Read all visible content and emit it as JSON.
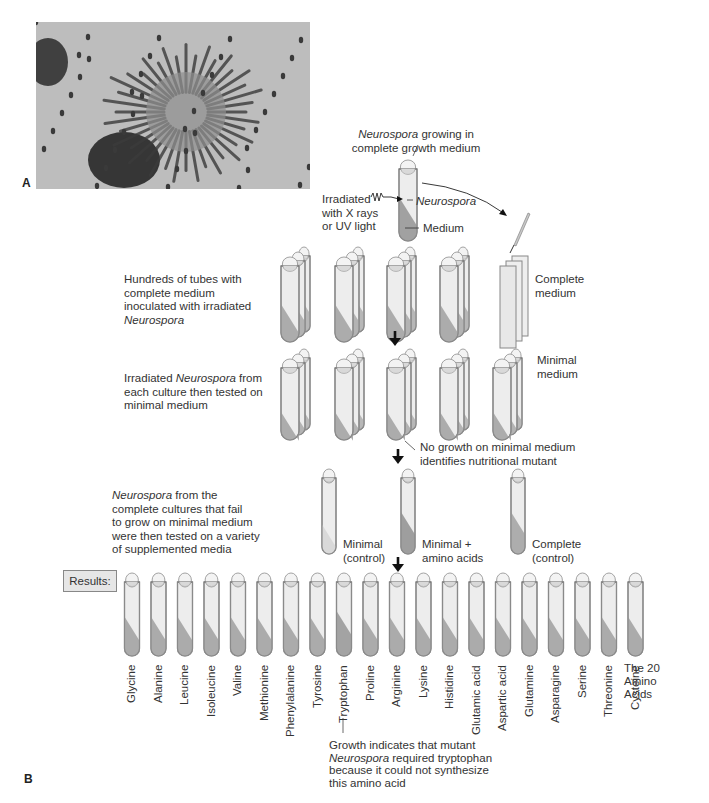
{
  "panels": {
    "a": "A",
    "b": "B"
  },
  "top_tube": {
    "caption_italic": "Neurospora",
    "caption_rest": " growing in",
    "caption_line2": "complete growth medium",
    "irradiation_label": [
      "Irradiated",
      "with X rays",
      "or UV light"
    ],
    "neurospora_label": "Neurospora",
    "medium_label": "Medium"
  },
  "steps": [
    {
      "lines_html": [
        "Hundreds of tubes with",
        "complete medium",
        "inoculated with irradiated"
      ],
      "italic_last": "Neurospora",
      "side_label": [
        "Complete",
        "medium"
      ]
    },
    {
      "line1_pre": "Irradiated ",
      "line1_italic": "Neurospora",
      "line1_post": " from",
      "lines": [
        "each culture then tested on",
        "minimal medium"
      ],
      "side_label": [
        "Minimal",
        "medium"
      ],
      "note": [
        "No growth on minimal medium",
        "identifies nutritional mutant"
      ]
    },
    {
      "line1_italic": "Neurospora",
      "line1_post": " from the",
      "lines": [
        "complete cultures that fail",
        "to grow on minimal medium",
        "were then tested on a variety",
        "of supplemented media"
      ],
      "tubes": [
        {
          "label": [
            "Minimal",
            "(control)"
          ],
          "growth": false
        },
        {
          "label": [
            "Minimal +",
            "amino acids"
          ],
          "growth": true
        },
        {
          "label": [
            "Complete",
            "(control)"
          ],
          "growth": true
        }
      ]
    }
  ],
  "results": {
    "label": "Results:",
    "amino_acids": [
      "Glycine",
      "Alanine",
      "Leucine",
      "Isoleucine",
      "Valine",
      "Methionine",
      "Phenylalanine",
      "Tyrosine",
      "Tryptophan",
      "Proline",
      "Arginine",
      "Lysine",
      "Histidine",
      "Glutamic acid",
      "Aspartic acid",
      "Glutamine",
      "Asparagine",
      "Serine",
      "Threonine",
      "Cysteine"
    ],
    "growth_index": 8,
    "group_label": [
      "The 20",
      "Amino",
      "Acids"
    ],
    "note_line1": "Growth indicates that mutant",
    "note_line2_italic": "Neurospora",
    "note_line2_rest": " required tryptophan",
    "note_line3": "because it could not synthesize",
    "note_line4": "this amino acid"
  },
  "colors": {
    "tube_outline": "#8a8a8a",
    "tube_fill": "#ededed",
    "medium": "#a9a9a9",
    "cap": "#d9d9d9"
  }
}
